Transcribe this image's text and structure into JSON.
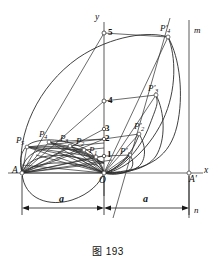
{
  "figure": {
    "caption": "图 193",
    "caption_number": "193",
    "axis_labels": {
      "x": "x",
      "y": "y",
      "origin": "O",
      "left_vertex": "A",
      "right_vertex": "A'",
      "line_top": "m",
      "line_bottom": "n"
    },
    "dimensions": [
      {
        "name": "left-span",
        "label": "a"
      },
      {
        "name": "right-span",
        "label": "a"
      }
    ],
    "y_ticks": [
      {
        "label": "1",
        "value": 1
      },
      {
        "label": "2",
        "value": 2
      },
      {
        "label": "3",
        "value": 3
      },
      {
        "label": "4",
        "value": 4
      },
      {
        "label": "5",
        "value": 5
      }
    ],
    "points_left": [
      {
        "base": "P",
        "sub": "1"
      },
      {
        "base": "P",
        "sub": "2"
      },
      {
        "base": "P",
        "sub": "3"
      },
      {
        "base": "P",
        "sub": "4"
      },
      {
        "base": "P",
        "sub": "5"
      }
    ],
    "points_right": [
      {
        "base": "P",
        "sub": "1",
        "prime": "'"
      },
      {
        "base": "P",
        "sub": "2",
        "prime": "'"
      },
      {
        "base": "P",
        "sub": "3",
        "prime": "'"
      },
      {
        "base": "P",
        "sub": "4",
        "prime": "'"
      }
    ],
    "colors": {
      "ink": "#1a1a1a",
      "curve": "#2b2b2b",
      "axis": "#6a6a6a",
      "background": "#ffffff"
    }
  }
}
